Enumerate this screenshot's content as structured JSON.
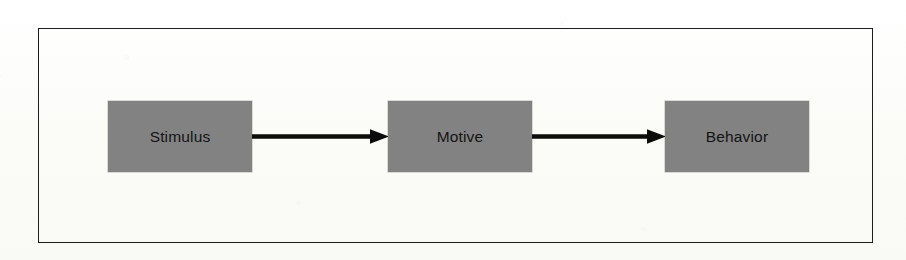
{
  "page": {
    "background_color": "#fdfdfb",
    "width": 906,
    "height": 260
  },
  "margin_artifact": {
    "name": "cut-off-glyph",
    "text": "e",
    "description": "partial character clipped at the left page margin"
  },
  "frame": {
    "name": "diagram-frame",
    "border_color": "#1d1d1d",
    "border_width_px": 1.6
  },
  "diagram": {
    "type": "flowchart",
    "orientation": "horizontal",
    "node_fill_color": "#828282",
    "node_text_color": "#141414",
    "arrow_color": "#0c0c0c",
    "nodes": [
      {
        "id": "stimulus",
        "label": "Stimulus"
      },
      {
        "id": "motive",
        "label": "Motive"
      },
      {
        "id": "behavior",
        "label": "Behavior"
      }
    ],
    "edges": [
      {
        "id": "edge-1",
        "from": "stimulus",
        "to": "motive",
        "style": "solid-arrow",
        "label": ""
      },
      {
        "id": "edge-2",
        "from": "motive",
        "to": "behavior",
        "style": "solid-arrow",
        "label": ""
      }
    ]
  }
}
